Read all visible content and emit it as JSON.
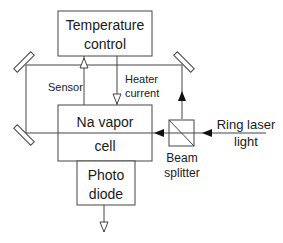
{
  "diagram": {
    "type": "optical-setup-block-diagram",
    "blocks": {
      "temperature_control": {
        "line1": "Temperature",
        "line2": "control"
      },
      "na_vapor_cell": {
        "line1": "Na vapor",
        "line2": "cell"
      },
      "photo_diode": {
        "line1": "Photo",
        "line2": "diode"
      },
      "beam_splitter": {
        "line1": "Beam",
        "line2": "splitter"
      }
    },
    "labels": {
      "sensor": "Sensor",
      "heater_line1": "Heater",
      "heater_line2": "current",
      "laser_line1": "Ring laser",
      "laser_line2": "light"
    },
    "components": [
      "mirror-top-left",
      "mirror-top-right",
      "mirror-bottom-left",
      "beam-splitter"
    ],
    "connections": [
      {
        "from": "na_vapor_cell",
        "to": "temperature_control",
        "label": "Sensor"
      },
      {
        "from": "temperature_control",
        "to": "na_vapor_cell",
        "label": "Heater current"
      },
      {
        "from": "ring_laser",
        "to": "beam_splitter",
        "label": "Ring laser light"
      },
      {
        "from": "beam_splitter",
        "to": "na_vapor_cell"
      },
      {
        "from": "beam_splitter",
        "to": "mirror-top-right"
      },
      {
        "from": "na_vapor_cell",
        "to": "photo_diode"
      }
    ],
    "colors": {
      "stroke": "#444444",
      "text": "#1a1a1a",
      "background": "#ffffff"
    }
  }
}
